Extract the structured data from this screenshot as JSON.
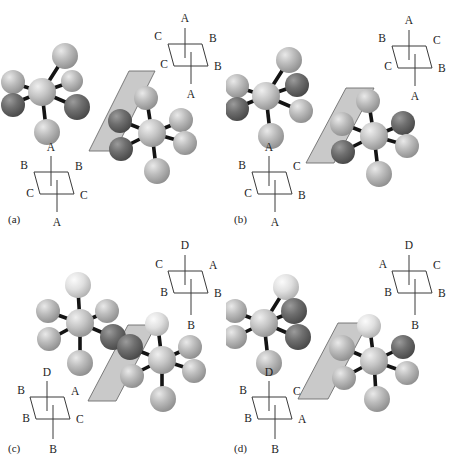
{
  "figure": {
    "type": "chemistry-structure-illustration",
    "background_color": "#ffffff",
    "panel_count": 4
  },
  "colors": {
    "plane_fill": "#c9c9c9",
    "plane_stroke": "#6e6e6e",
    "bond": "#141414",
    "atom_center": "#c0c0c0",
    "atom_light": "#b9b9b9",
    "atom_white": "#e6e6e6",
    "atom_dark": "#6b6b6b",
    "label_text": "#1d1d1d"
  },
  "panels": [
    {
      "id": "a",
      "label": "(a)",
      "top_right_projection": {
        "name": "sawhorse-top-right",
        "top": "A",
        "upper_left": "C",
        "upper_right": "B",
        "lower_left": "C",
        "lower_right": "B",
        "bottom": "A"
      },
      "bottom_left_projection": {
        "name": "sawhorse-bottom-left",
        "top": "A",
        "upper_left": "B",
        "upper_right": "B",
        "lower_left": "C",
        "lower_right": "C",
        "bottom": "A"
      },
      "left_molecule": {
        "top": "light",
        "upper_left": "light",
        "upper_right": "light",
        "lower_left": "dark",
        "lower_right": "dark",
        "bottom": "light"
      },
      "right_molecule": {
        "top": "light",
        "upper_left": "dark",
        "upper_right": "light",
        "lower_left": "dark",
        "lower_right": "light",
        "bottom": "light"
      }
    },
    {
      "id": "b",
      "label": "(b)",
      "top_right_projection": {
        "name": "sawhorse-top-right",
        "top": "A",
        "upper_left": "B",
        "upper_right": "C",
        "lower_left": "C",
        "lower_right": "B",
        "bottom": "A"
      },
      "bottom_left_projection": {
        "name": "sawhorse-bottom-left",
        "top": "A",
        "upper_left": "B",
        "upper_right": "C",
        "lower_left": "C",
        "lower_right": "B",
        "bottom": "A"
      },
      "left_molecule": {
        "top": "light",
        "upper_left": "light",
        "upper_right": "dark",
        "lower_left": "dark",
        "lower_right": "light",
        "bottom": "light"
      },
      "right_molecule": {
        "top": "light",
        "upper_left": "light",
        "upper_right": "dark",
        "lower_left": "dark",
        "lower_right": "light",
        "bottom": "light"
      }
    },
    {
      "id": "c",
      "label": "(c)",
      "top_right_projection": {
        "name": "sawhorse-top-right",
        "top": "D",
        "upper_left": "C",
        "upper_right": "A",
        "lower_left": "B",
        "lower_right": "B",
        "bottom": "B"
      },
      "bottom_left_projection": {
        "name": "sawhorse-bottom-left",
        "top": "D",
        "upper_left": "B",
        "upper_right": "A",
        "lower_left": "B",
        "lower_right": "C",
        "bottom": "B"
      },
      "left_molecule": {
        "top": "white",
        "upper_left": "light",
        "upper_right": "light",
        "lower_left": "light",
        "lower_right": "dark",
        "bottom": "light"
      },
      "right_molecule": {
        "top": "white",
        "upper_left": "dark",
        "upper_right": "light",
        "lower_left": "light",
        "lower_right": "light",
        "bottom": "light"
      }
    },
    {
      "id": "d",
      "label": "(d)",
      "top_right_projection": {
        "name": "sawhorse-top-right",
        "top": "D",
        "upper_left": "A",
        "upper_right": "C",
        "lower_left": "B",
        "lower_right": "B",
        "bottom": "B"
      },
      "bottom_left_projection": {
        "name": "sawhorse-bottom-left",
        "top": "D",
        "upper_left": "B",
        "upper_right": "C",
        "lower_left": "B",
        "lower_right": "A",
        "bottom": "B"
      },
      "left_molecule": {
        "top": "white",
        "upper_left": "light",
        "upper_right": "dark",
        "lower_left": "light",
        "lower_right": "dark",
        "bottom": "light"
      },
      "right_molecule": {
        "top": "white",
        "upper_left": "light",
        "upper_right": "dark",
        "lower_left": "light",
        "lower_right": "light",
        "bottom": "light"
      }
    }
  ]
}
